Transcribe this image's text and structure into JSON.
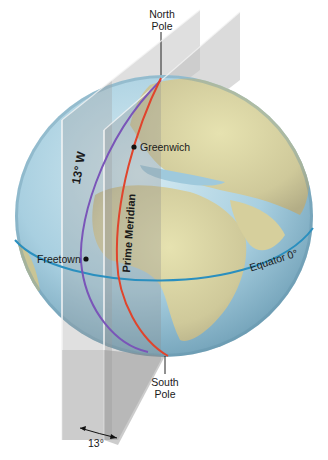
{
  "diagram": {
    "labels": {
      "north_pole": [
        "North",
        "Pole"
      ],
      "south_pole": [
        "South",
        "Pole"
      ],
      "greenwich": "Greenwich",
      "freetown": "Freetown",
      "prime_meridian": "Prime Meridian",
      "meridian_13w": "13° W",
      "equator": "Equator 0°",
      "angle": "13°"
    },
    "colors": {
      "prime_meridian": "#e0442c",
      "meridian_13w": "#7a55b8",
      "equator": "#2a8fbf",
      "ocean": "#a9cfe0",
      "land": "#d9d7a4",
      "plane": "#9a9a9a"
    }
  }
}
